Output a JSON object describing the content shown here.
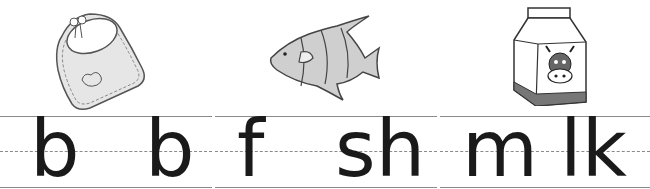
{
  "worksheet": {
    "cards": [
      {
        "picture": "bib",
        "picture_icon": "bib-icon",
        "letters": [
          "b",
          "b"
        ],
        "word": "bib"
      },
      {
        "picture": "fish",
        "picture_icon": "fish-icon",
        "letters": [
          "f",
          "sh"
        ],
        "word": "fish"
      },
      {
        "picture": "milk carton",
        "picture_icon": "milk-carton-icon",
        "letters": [
          "m",
          "lk"
        ],
        "word": "milk"
      }
    ],
    "colors": {
      "rule": "#8a8a8a",
      "ink": "#1a1a1a",
      "fill_light": "#e6e6e6",
      "fill_mid": "#bdbdbd",
      "fill_dark": "#666666"
    }
  }
}
